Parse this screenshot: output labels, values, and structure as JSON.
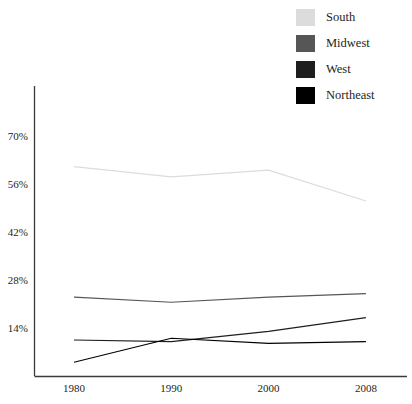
{
  "legend": {
    "position": "top-right",
    "items": [
      {
        "label": "South",
        "color": "#dcdcdc"
      },
      {
        "label": "Midwest",
        "color": "#565656"
      },
      {
        "label": "West",
        "color": "#1e1e1e"
      },
      {
        "label": "Northeast",
        "color": "#000000"
      }
    ]
  },
  "axes": {
    "y_ticks": [
      "70%",
      "56%",
      "42%",
      "28%",
      "14%"
    ],
    "x_ticks": [
      "1980",
      "1990",
      "2000",
      "2008"
    ]
  },
  "chart_data": {
    "type": "line",
    "title": "",
    "xlabel": "",
    "ylabel": "",
    "categories": [
      "1980",
      "1990",
      "2000",
      "2008"
    ],
    "x": [
      1980,
      1990,
      2000,
      2008
    ],
    "ylim": [
      0,
      70
    ],
    "ytick_values": [
      14,
      28,
      42,
      56,
      70
    ],
    "grid": false,
    "legend_position": "top-right",
    "series": [
      {
        "name": "South",
        "color": "#dcdcdc",
        "values": [
          61.0,
          58.0,
          60.0,
          51.0
        ]
      },
      {
        "name": "Midwest",
        "color": "#565656",
        "values": [
          23.0,
          21.5,
          23.0,
          24.0
        ]
      },
      {
        "name": "West",
        "color": "#1e1e1e",
        "values": [
          10.5,
          10.0,
          13.0,
          17.0
        ]
      },
      {
        "name": "Northeast",
        "color": "#000000",
        "values": [
          4.0,
          11.0,
          9.5,
          10.0
        ]
      }
    ]
  }
}
